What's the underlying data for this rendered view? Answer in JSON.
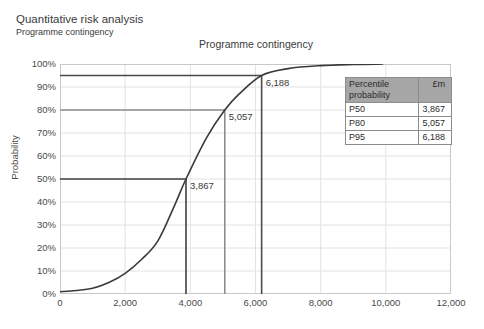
{
  "document": {
    "title": "Quantitative risk analysis",
    "subtitle": "Programme contingency"
  },
  "chart_data": {
    "type": "line",
    "title": "Programme contingency",
    "xlabel": "",
    "ylabel": "Probability",
    "xlim": [
      0,
      12000
    ],
    "ylim": [
      0,
      1
    ],
    "grid": true,
    "legend_position": "inside-right",
    "x_ticks": [
      "0",
      "2,000",
      "4,000",
      "6,000",
      "8,000",
      "10,000",
      "12,000"
    ],
    "x_tick_values": [
      0,
      2000,
      4000,
      6000,
      8000,
      10000,
      12000
    ],
    "y_ticks": [
      "0%",
      "10%",
      "20%",
      "30%",
      "40%",
      "50%",
      "60%",
      "70%",
      "80%",
      "90%",
      "100%"
    ],
    "y_tick_values": [
      0,
      10,
      20,
      30,
      40,
      50,
      60,
      70,
      80,
      90,
      100
    ],
    "series": [
      {
        "name": "S-curve cumulative probability",
        "x": [
          0,
          500,
          1000,
          1500,
          2000,
          2500,
          3000,
          3500,
          3867,
          4500,
          5057,
          5500,
          6188,
          7000,
          8000,
          9000,
          9900
        ],
        "values": [
          1,
          1.5,
          2.5,
          5,
          9,
          15,
          23,
          38,
          50,
          68,
          80,
          87,
          95,
          98,
          99.3,
          99.8,
          100
        ]
      }
    ],
    "annotations": [
      {
        "label": "3,867",
        "x": 3867,
        "y": 50
      },
      {
        "label": "5,057",
        "x": 5057,
        "y": 80
      },
      {
        "label": "6,188",
        "x": 6188,
        "y": 95
      }
    ],
    "markers": [
      {
        "label": "P50",
        "x": 3867,
        "y": 50,
        "color": "#3f3f3f"
      },
      {
        "label": "P80",
        "x": 5057,
        "y": 80,
        "color": "#8c8c8c"
      },
      {
        "label": "P95",
        "x": 6188,
        "y": 95,
        "color": "#4a4a4a"
      }
    ]
  },
  "legend": {
    "headers": [
      "Percentile probability",
      "£m"
    ],
    "rows": [
      {
        "percentile": "P50",
        "value": "3,867"
      },
      {
        "percentile": "P80",
        "value": "5,057"
      },
      {
        "percentile": "P95",
        "value": "6,188"
      }
    ]
  },
  "colors": {
    "curve": "#3a3a3a",
    "grid": "#e2e2e2",
    "frame": "#c8c8c8",
    "header_fill": "#a6a6a6"
  }
}
